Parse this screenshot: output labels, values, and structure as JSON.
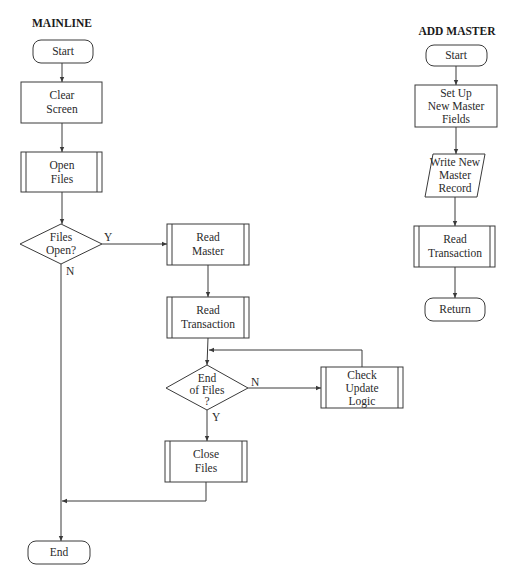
{
  "mainline": {
    "title": "MAINLINE",
    "start": "Start",
    "clear_screen": [
      "Clear",
      "Screen"
    ],
    "open_files": [
      "Open",
      "Files"
    ],
    "files_open_decision": [
      "Files",
      "Open?"
    ],
    "files_open_yes": "Y",
    "files_open_no": "N",
    "read_master": [
      "Read",
      "Master"
    ],
    "read_transaction": [
      "Read",
      "Transaction"
    ],
    "end_of_files_decision": [
      "End",
      "of Files",
      "?"
    ],
    "end_of_files_no": "N",
    "end_of_files_yes": "Y",
    "check_update_logic": [
      "Check",
      "Update",
      "Logic"
    ],
    "close_files": [
      "Close",
      "Files"
    ],
    "end": "End"
  },
  "add_master": {
    "title": "ADD MASTER",
    "start": "Start",
    "set_up_fields": [
      "Set Up",
      "New Master",
      "Fields"
    ],
    "write_record": [
      "Write New",
      "Master",
      "Record"
    ],
    "read_transaction": [
      "Read",
      "Transaction"
    ],
    "return": "Return"
  },
  "colors": {
    "stroke": "#3a3a3a",
    "text": "#2a2a2a",
    "background": "#ffffff"
  }
}
